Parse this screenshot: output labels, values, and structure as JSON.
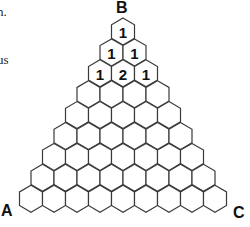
{
  "fragments": {
    "line1": "n.",
    "line2": "us"
  },
  "vertices": {
    "top": "B",
    "bottom_left": "A",
    "bottom_right": "C"
  },
  "grid": {
    "rows": 9,
    "hex_width": 23,
    "hex_height": 27,
    "row_spacing": 20.9,
    "apex_x": 123,
    "apex_y": 18,
    "stroke_color": "#3a3a3a",
    "fill_color": "#ffffff",
    "filled_values": [
      [
        "1"
      ],
      [
        "1",
        "1"
      ],
      [
        "1",
        "2",
        "1"
      ]
    ]
  }
}
